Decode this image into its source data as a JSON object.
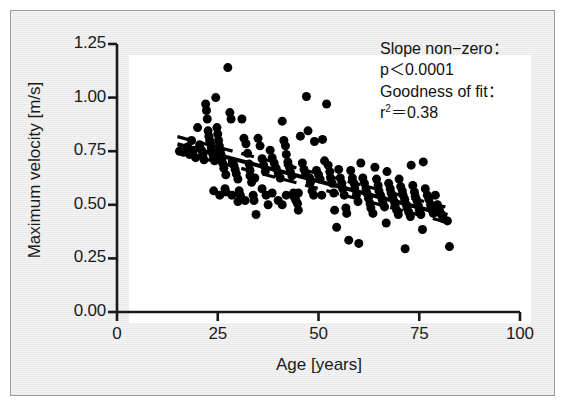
{
  "figure": {
    "background_color": "#eaeaea",
    "plot_background_color": "#ffffff",
    "axis_color": "#1a1a1a",
    "point_color": "#000000"
  },
  "annotation": {
    "line1": "Slope non−zero：",
    "line2": "p＜0.0001",
    "line3": "Goodness of fit：",
    "line4_prefix": "r",
    "line4_sup": "2",
    "line4_suffix": "＝0.38"
  },
  "chart_data": {
    "type": "scatter",
    "title": "",
    "xlabel": "Age [years]",
    "ylabel": "Maximum velocity [m/s]",
    "xlim": [
      0,
      100
    ],
    "ylim": [
      0.0,
      1.25
    ],
    "xticks": [
      0,
      25,
      50,
      75,
      100
    ],
    "xticklabels": [
      "0",
      "25",
      "50",
      "75",
      "100"
    ],
    "yticks": [
      0.0,
      0.25,
      0.5,
      0.75,
      1.0,
      1.25
    ],
    "yticklabels": [
      "0.00",
      "0.25",
      "0.50",
      "0.75",
      "1.00",
      "1.25"
    ],
    "grid": false,
    "legend": null,
    "marker": "filled-circle",
    "marker_size_px": 9,
    "statistics": {
      "slope_test": "Slope non−zero",
      "p_value": "p＜0.0001",
      "goodness_of_fit_label": "Goodness of fit",
      "r_squared": 0.38
    },
    "fit_lines": [
      {
        "name": "regression-line",
        "style": "solid",
        "x": [
          15,
          82
        ],
        "y": [
          0.782,
          0.452
        ]
      },
      {
        "name": "confidence-upper",
        "style": "dashed",
        "x": [
          15,
          82
        ],
        "y": [
          0.818,
          0.487
        ]
      },
      {
        "name": "confidence-lower",
        "style": "dashed",
        "x": [
          15,
          82
        ],
        "y": [
          0.748,
          0.418
        ]
      }
    ],
    "points": [
      [
        15.5,
        0.75
      ],
      [
        16.5,
        0.745
      ],
      [
        17.5,
        0.77
      ],
      [
        18.0,
        0.735
      ],
      [
        18.5,
        0.8
      ],
      [
        19.0,
        0.755
      ],
      [
        19.5,
        0.72
      ],
      [
        20.0,
        0.86
      ],
      [
        20.5,
        0.78
      ],
      [
        21.0,
        0.755
      ],
      [
        21.3,
        0.735
      ],
      [
        21.6,
        0.71
      ],
      [
        22.0,
        0.97
      ],
      [
        22.2,
        0.94
      ],
      [
        22.4,
        0.9
      ],
      [
        22.6,
        0.845
      ],
      [
        22.8,
        0.82
      ],
      [
        23.0,
        0.8
      ],
      [
        23.2,
        0.785
      ],
      [
        23.4,
        0.765
      ],
      [
        23.6,
        0.75
      ],
      [
        23.8,
        0.735
      ],
      [
        24.0,
        0.72
      ],
      [
        24.2,
        0.705
      ],
      [
        24.5,
        1.0
      ],
      [
        24.8,
        0.86
      ],
      [
        25.0,
        0.83
      ],
      [
        25.2,
        0.8
      ],
      [
        25.4,
        0.775
      ],
      [
        25.6,
        0.755
      ],
      [
        25.8,
        0.735
      ],
      [
        26.0,
        0.715
      ],
      [
        26.2,
        0.695
      ],
      [
        26.5,
        0.67
      ],
      [
        26.8,
        0.575
      ],
      [
        27.0,
        0.56
      ],
      [
        27.5,
        1.14
      ],
      [
        28.0,
        0.93
      ],
      [
        28.3,
        0.9
      ],
      [
        28.6,
        0.7
      ],
      [
        29.0,
        0.685
      ],
      [
        29.3,
        0.665
      ],
      [
        29.6,
        0.645
      ],
      [
        30.0,
        0.62
      ],
      [
        30.3,
        0.565
      ],
      [
        30.6,
        0.545
      ],
      [
        31.0,
        0.9
      ],
      [
        31.5,
        0.81
      ],
      [
        32.0,
        0.785
      ],
      [
        32.4,
        0.74
      ],
      [
        32.8,
        0.69
      ],
      [
        33.0,
        0.635
      ],
      [
        33.4,
        0.605
      ],
      [
        33.8,
        0.545
      ],
      [
        34.0,
        0.52
      ],
      [
        34.5,
        0.455
      ],
      [
        35.0,
        0.81
      ],
      [
        35.5,
        0.775
      ],
      [
        36.0,
        0.715
      ],
      [
        36.4,
        0.685
      ],
      [
        36.8,
        0.655
      ],
      [
        37.0,
        0.545
      ],
      [
        37.5,
        0.5
      ],
      [
        38.0,
        0.755
      ],
      [
        38.5,
        0.72
      ],
      [
        39.0,
        0.695
      ],
      [
        39.5,
        0.67
      ],
      [
        40.0,
        0.645
      ],
      [
        40.5,
        0.625
      ],
      [
        41.0,
        0.89
      ],
      [
        41.4,
        0.8
      ],
      [
        41.8,
        0.775
      ],
      [
        42.0,
        0.735
      ],
      [
        42.4,
        0.7
      ],
      [
        42.8,
        0.675
      ],
      [
        43.0,
        0.655
      ],
      [
        43.4,
        0.635
      ],
      [
        43.8,
        0.555
      ],
      [
        44.0,
        0.535
      ],
      [
        44.4,
        0.52
      ],
      [
        44.8,
        0.505
      ],
      [
        45.0,
        0.475
      ],
      [
        45.5,
        0.82
      ],
      [
        46.0,
        0.695
      ],
      [
        46.4,
        0.665
      ],
      [
        46.8,
        0.645
      ],
      [
        47.0,
        1.005
      ],
      [
        47.4,
        0.845
      ],
      [
        47.8,
        0.625
      ],
      [
        48.0,
        0.605
      ],
      [
        48.4,
        0.565
      ],
      [
        48.8,
        0.545
      ],
      [
        49.0,
        0.795
      ],
      [
        49.5,
        0.66
      ],
      [
        50.0,
        0.64
      ],
      [
        50.4,
        0.62
      ],
      [
        50.8,
        0.545
      ],
      [
        51.0,
        0.805
      ],
      [
        51.5,
        0.705
      ],
      [
        52.0,
        0.97
      ],
      [
        52.4,
        0.685
      ],
      [
        52.8,
        0.655
      ],
      [
        53.0,
        0.625
      ],
      [
        53.4,
        0.6
      ],
      [
        53.8,
        0.555
      ],
      [
        54.0,
        0.475
      ],
      [
        54.5,
        0.395
      ],
      [
        55.0,
        0.665
      ],
      [
        55.4,
        0.625
      ],
      [
        55.8,
        0.6
      ],
      [
        56.0,
        0.575
      ],
      [
        56.4,
        0.545
      ],
      [
        56.8,
        0.485
      ],
      [
        57.0,
        0.46
      ],
      [
        57.5,
        0.335
      ],
      [
        58.0,
        0.66
      ],
      [
        58.4,
        0.625
      ],
      [
        58.8,
        0.6
      ],
      [
        59.0,
        0.575
      ],
      [
        59.4,
        0.545
      ],
      [
        59.8,
        0.515
      ],
      [
        60.0,
        0.32
      ],
      [
        60.5,
        0.695
      ],
      [
        61.0,
        0.625
      ],
      [
        61.4,
        0.6
      ],
      [
        61.8,
        0.575
      ],
      [
        62.0,
        0.555
      ],
      [
        62.4,
        0.53
      ],
      [
        62.8,
        0.505
      ],
      [
        63.0,
        0.485
      ],
      [
        63.5,
        0.46
      ],
      [
        64.0,
        0.675
      ],
      [
        64.4,
        0.62
      ],
      [
        64.8,
        0.59
      ],
      [
        65.0,
        0.565
      ],
      [
        65.4,
        0.545
      ],
      [
        65.8,
        0.525
      ],
      [
        66.0,
        0.505
      ],
      [
        66.4,
        0.49
      ],
      [
        66.8,
        0.415
      ],
      [
        67.0,
        0.655
      ],
      [
        67.4,
        0.6
      ],
      [
        67.8,
        0.575
      ],
      [
        68.0,
        0.555
      ],
      [
        68.4,
        0.535
      ],
      [
        68.8,
        0.515
      ],
      [
        69.0,
        0.495
      ],
      [
        69.4,
        0.475
      ],
      [
        69.8,
        0.455
      ],
      [
        70.0,
        0.62
      ],
      [
        70.4,
        0.585
      ],
      [
        70.8,
        0.565
      ],
      [
        71.0,
        0.545
      ],
      [
        71.4,
        0.525
      ],
      [
        71.8,
        0.5
      ],
      [
        72.0,
        0.485
      ],
      [
        72.4,
        0.465
      ],
      [
        72.8,
        0.445
      ],
      [
        73.0,
        0.685
      ],
      [
        73.4,
        0.59
      ],
      [
        73.8,
        0.56
      ],
      [
        74.0,
        0.54
      ],
      [
        74.4,
        0.52
      ],
      [
        74.8,
        0.495
      ],
      [
        75.0,
        0.475
      ],
      [
        75.4,
        0.455
      ],
      [
        75.8,
        0.385
      ],
      [
        76.0,
        0.7
      ],
      [
        76.5,
        0.575
      ],
      [
        77.0,
        0.545
      ],
      [
        77.4,
        0.525
      ],
      [
        77.8,
        0.5
      ],
      [
        78.0,
        0.48
      ],
      [
        78.5,
        0.46
      ],
      [
        79.0,
        0.545
      ],
      [
        79.5,
        0.5
      ],
      [
        80.0,
        0.475
      ],
      [
        80.5,
        0.455
      ],
      [
        81.0,
        0.435
      ],
      [
        82.0,
        0.425
      ],
      [
        82.5,
        0.305
      ],
      [
        71.5,
        0.295
      ],
      [
        24.0,
        0.565
      ],
      [
        25.5,
        0.545
      ],
      [
        27.0,
        0.64
      ],
      [
        28.5,
        0.545
      ],
      [
        30.0,
        0.515
      ],
      [
        31.8,
        0.52
      ],
      [
        40.0,
        0.52
      ],
      [
        41.0,
        0.5
      ],
      [
        42.0,
        0.545
      ],
      [
        45.0,
        0.555
      ],
      [
        33.0,
        0.66
      ],
      [
        34.2,
        0.625
      ],
      [
        36.0,
        0.575
      ],
      [
        38.5,
        0.555
      ]
    ]
  }
}
